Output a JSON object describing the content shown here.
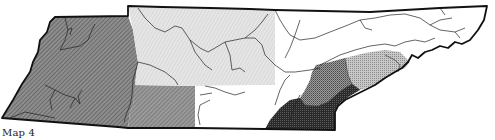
{
  "caption": "Map 4",
  "regions": [
    {
      "id": "west",
      "fill": "#7a7a7a",
      "pattern": "diagonal-hatch-dark"
    },
    {
      "id": "west-central-south",
      "fill": "#8a8a8a",
      "pattern": "diagonal-hatch"
    },
    {
      "id": "north-central",
      "fill": "#dcdcdc",
      "pattern": "light-stipple"
    },
    {
      "id": "east-plateau",
      "fill": "#ffffff",
      "pattern": "none"
    },
    {
      "id": "east-ridge-light",
      "fill": "#bdbdbd",
      "pattern": "stipple"
    },
    {
      "id": "east-ridge-mid",
      "fill": "#8c8c8c",
      "pattern": "dense-stipple"
    },
    {
      "id": "southeast-dark",
      "fill": "#3a3a3a",
      "pattern": "very-dense-stipple"
    }
  ],
  "colors": {
    "border": "#111111",
    "river": "#333333"
  }
}
